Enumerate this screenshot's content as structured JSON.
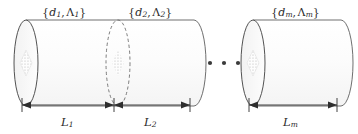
{
  "figure": {
    "type": "diagram",
    "background_color": "#ffffff",
    "stroke_color": "#4a4a4a",
    "body_fill_color": "#fbfbfb",
    "cap_fill_color": "#f7f7f7"
  },
  "segment_labels": [
    {
      "id": "segment-1",
      "open": "{",
      "d": "d",
      "d_sub": "1",
      "comma": ",",
      "lambda": "Λ",
      "lambda_sub": "1",
      "close": "}"
    },
    {
      "id": "segment-2",
      "open": "{",
      "d": "d",
      "d_sub": "2",
      "comma": ",",
      "lambda": "Λ",
      "lambda_sub": "2",
      "close": "}"
    },
    {
      "id": "segment-m",
      "open": "{",
      "d": "d",
      "d_sub": "m",
      "comma": ",",
      "lambda": "Λ",
      "lambda_sub": "m",
      "close": "}"
    }
  ],
  "dimension_labels": [
    {
      "id": "length-1",
      "symbol": "L",
      "sub": "1"
    },
    {
      "id": "length-2",
      "symbol": "L",
      "sub": "2"
    },
    {
      "id": "length-m",
      "symbol": "L",
      "sub": "m"
    }
  ],
  "ellipsis": {
    "symbol": "· · ·",
    "dot_count": 3,
    "meaning": "continuation of intermediate segments"
  },
  "geometry": {
    "cylinder_a": {
      "left_cap_x": 26,
      "right_cap_x": 194,
      "center_y": 63,
      "ry": 43,
      "rx": 12
    },
    "cylinder_b": {
      "left_cap_x": 253,
      "right_cap_x": 341,
      "center_y": 63,
      "ry": 43,
      "rx": 12
    },
    "interface_dashed_x": 118,
    "dimension_axis_y": 105
  }
}
